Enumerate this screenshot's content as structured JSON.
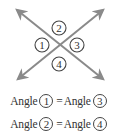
{
  "diagram": {
    "line_color": "#8a8a8a",
    "circle_color": "#444444",
    "text_color": "#333333",
    "intersection": {
      "x": 60,
      "y": 44
    },
    "lines": [
      {
        "from": {
          "x": 17,
          "y": 10
        },
        "to": {
          "x": 103,
          "y": 79
        },
        "arrows": "both"
      },
      {
        "from": {
          "x": 103,
          "y": 10
        },
        "to": {
          "x": 18,
          "y": 79
        },
        "arrows": "both"
      }
    ],
    "angle_labels": [
      {
        "id": "angle-1",
        "label": "1",
        "x": 42,
        "y": 45
      },
      {
        "id": "angle-2",
        "label": "2",
        "x": 59,
        "y": 28
      },
      {
        "id": "angle-3",
        "label": "3",
        "x": 77,
        "y": 45
      },
      {
        "id": "angle-4",
        "label": "4",
        "x": 59,
        "y": 64
      }
    ]
  },
  "equations": [
    {
      "left_word": "Angle",
      "left_num": "1",
      "sign": "=",
      "right_word": "Angle",
      "right_num": "3"
    },
    {
      "left_word": "Angle",
      "left_num": "2",
      "sign": "=",
      "right_word": "Angle",
      "right_num": "4"
    }
  ]
}
